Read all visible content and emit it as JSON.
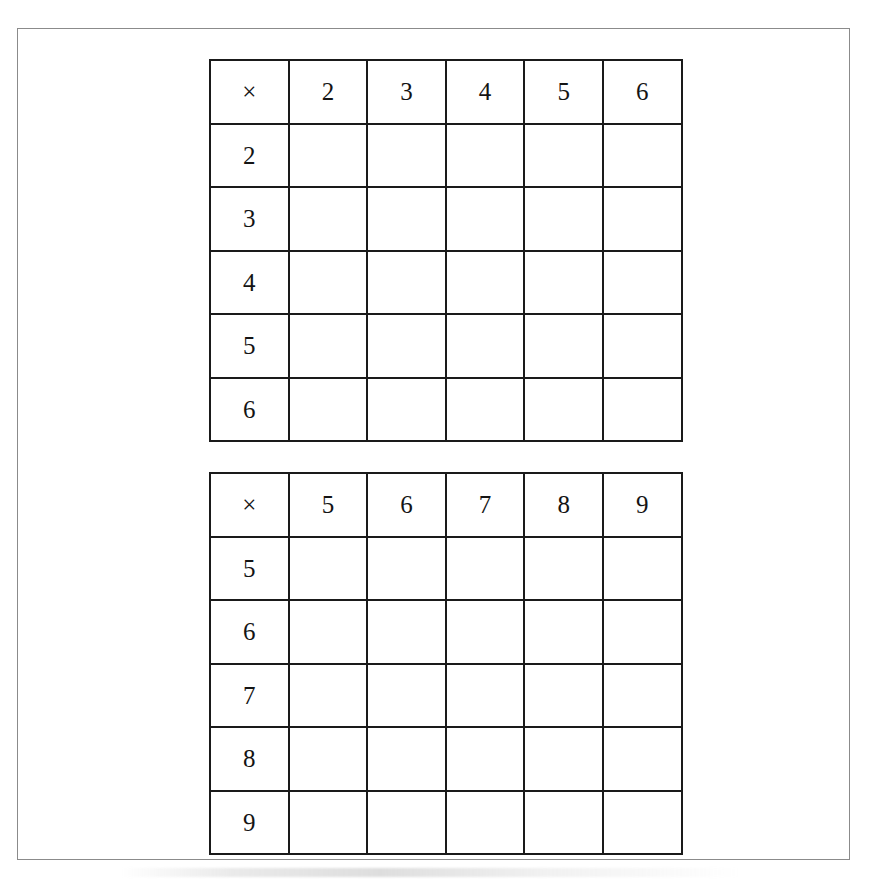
{
  "document": {
    "kind": "worksheet-page",
    "background_color": "#ffffff",
    "page_border_color": "#8b8b8b",
    "grid_line_color": "#1a1a1a"
  },
  "tables": [
    {
      "name": "multiplication-grid-2-to-6",
      "operator_symbol": "×",
      "column_headers": [
        "2",
        "3",
        "4",
        "5",
        "6"
      ],
      "row_headers": [
        "2",
        "3",
        "4",
        "5",
        "6"
      ],
      "cells": [
        [
          "",
          "",
          "",
          "",
          ""
        ],
        [
          "",
          "",
          "",
          "",
          ""
        ],
        [
          "",
          "",
          "",
          "",
          ""
        ],
        [
          "",
          "",
          "",
          "",
          ""
        ],
        [
          "",
          "",
          "",
          "",
          ""
        ]
      ]
    },
    {
      "name": "multiplication-grid-5-to-9",
      "operator_symbol": "×",
      "column_headers": [
        "5",
        "6",
        "7",
        "8",
        "9"
      ],
      "row_headers": [
        "5",
        "6",
        "7",
        "8",
        "9"
      ],
      "cells": [
        [
          "",
          "",
          "",
          "",
          ""
        ],
        [
          "",
          "",
          "",
          "",
          ""
        ],
        [
          "",
          "",
          "",
          "",
          ""
        ],
        [
          "",
          "",
          "",
          "",
          ""
        ],
        [
          "",
          "",
          "",
          "",
          ""
        ]
      ]
    }
  ]
}
